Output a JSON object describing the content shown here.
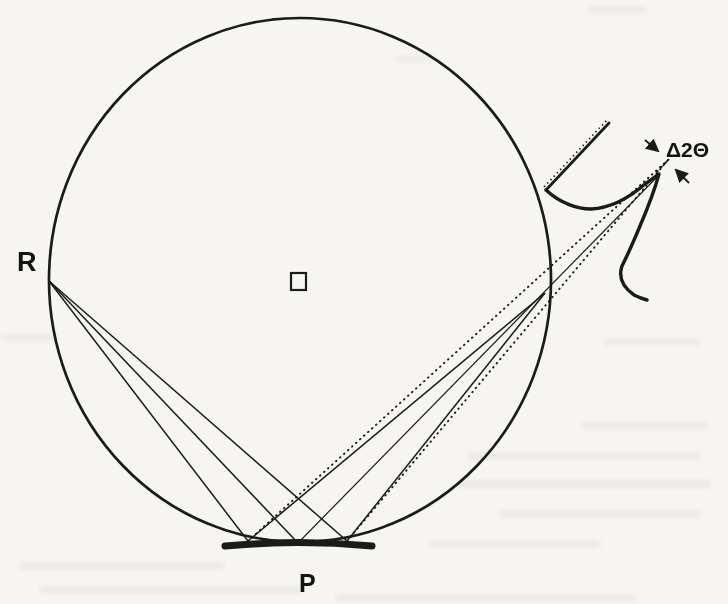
{
  "figure": {
    "labels": {
      "receiving_point": "R",
      "specimen": "P",
      "peak_width": "Δ2Θ"
    },
    "colors": {
      "ink": "#1b1b1b",
      "paper": "#f6f5f2"
    }
  }
}
